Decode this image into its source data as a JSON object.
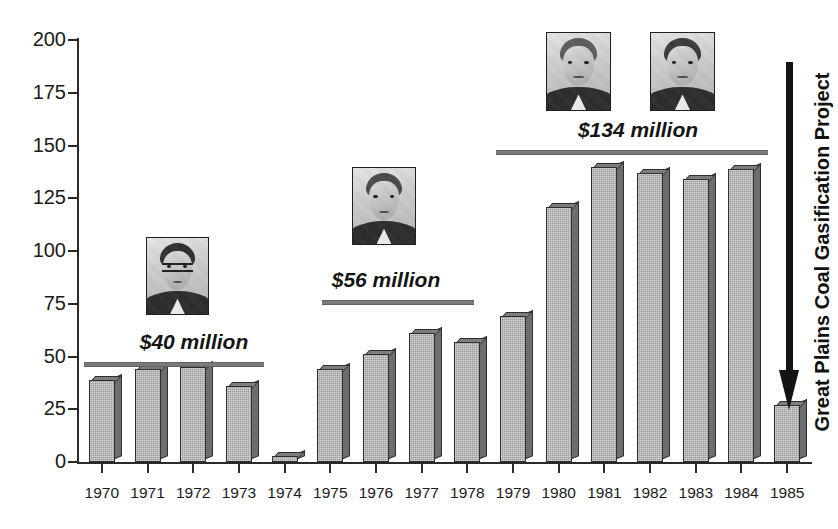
{
  "chart_data": {
    "type": "bar",
    "title": "",
    "subtitle": "",
    "xlabel": "",
    "ylabel": "",
    "ylim": [
      0,
      200
    ],
    "ytick_values": [
      0,
      25,
      50,
      75,
      100,
      125,
      150,
      175,
      200
    ],
    "ytick_labels": [
      "0",
      "25",
      "50",
      "75",
      "100",
      "125",
      "150",
      "175",
      "200"
    ],
    "grid": false,
    "legend": false,
    "categories": [
      "1970",
      "1971",
      "1972",
      "1973",
      "1974",
      "1975",
      "1976",
      "1977",
      "1978",
      "1979",
      "1980",
      "1981",
      "1982",
      "1983",
      "1984",
      "1985"
    ],
    "values": [
      39,
      44,
      45,
      36,
      3,
      44,
      51,
      61,
      57,
      69,
      121,
      140,
      137,
      134,
      139,
      27
    ],
    "bar_style": "3d-gray",
    "bar_fill_color": "#9a9a9a",
    "bar_edge_color": "#2f2f2f",
    "annotations": [
      {
        "name": "era-1",
        "label": "$40 million",
        "span_categories": [
          "1970",
          "1973"
        ],
        "has_photo": true,
        "photo_count": 1
      },
      {
        "name": "era-2",
        "label": "$56 million",
        "span_categories": [
          "1975",
          "1979"
        ],
        "has_photo": true,
        "photo_count": 1
      },
      {
        "name": "era-3",
        "label": "$134 million",
        "span_categories": [
          "1980",
          "1984"
        ],
        "has_photo": true,
        "photo_count": 2
      },
      {
        "name": "project-callout",
        "label": "Great Plains Coal Gasification Project",
        "orientation": "vertical",
        "arrow": "down"
      }
    ]
  },
  "axes": {
    "y_ticks": [
      {
        "label": "200",
        "value": 200
      },
      {
        "label": "175",
        "value": 175
      },
      {
        "label": "150",
        "value": 150
      },
      {
        "label": "125",
        "value": 125
      },
      {
        "label": "100",
        "value": 100
      },
      {
        "label": "75",
        "value": 75
      },
      {
        "label": "50",
        "value": 50
      },
      {
        "label": "25",
        "value": 25
      },
      {
        "label": "0",
        "value": 0
      }
    ],
    "x_ticks": [
      {
        "label": "1970"
      },
      {
        "label": "1971"
      },
      {
        "label": "1972"
      },
      {
        "label": "1973"
      },
      {
        "label": "1974"
      },
      {
        "label": "1975"
      },
      {
        "label": "1976"
      },
      {
        "label": "1977"
      },
      {
        "label": "1978"
      },
      {
        "label": "1979"
      },
      {
        "label": "1980"
      },
      {
        "label": "1981"
      },
      {
        "label": "1982"
      },
      {
        "label": "1983"
      },
      {
        "label": "1984"
      },
      {
        "label": "1985"
      }
    ]
  },
  "eras": {
    "era1_label": "$40 million",
    "era2_label": "$56 million",
    "era3_label": "$134 million"
  },
  "project": {
    "vertical_label": "Great Plains Coal Gasification Project"
  },
  "colors": {
    "bar_fill": "#9a9a9a",
    "bar_side": "#6e6e6e",
    "bar_top": "#7d7d7d",
    "bar_edge": "#2f2f2f",
    "axis": "#2a2a2a",
    "era_rule": "#7a7a7a",
    "arrow": "#131313",
    "text": "#1a1a1a",
    "background": "#ffffff"
  }
}
